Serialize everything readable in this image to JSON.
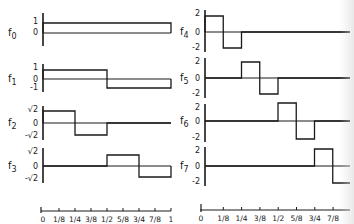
{
  "figure": {
    "ink_color": "#1a1a1a",
    "background": "#ffffff"
  },
  "left_panel": {
    "functions": [
      {
        "name": "f",
        "sub": "0",
        "ylabels": [
          "1",
          "0"
        ],
        "segments": [
          [
            0,
            1,
            1
          ]
        ]
      },
      {
        "name": "f",
        "sub": "1",
        "ylabels": [
          "1",
          "0",
          "-1"
        ],
        "segments": [
          [
            0,
            0.5,
            1
          ],
          [
            0.5,
            1,
            -1
          ]
        ]
      },
      {
        "name": "f",
        "sub": "2",
        "ylabels": [
          "√2",
          "0",
          "-√2"
        ],
        "segments": [
          [
            0,
            0.25,
            1.414
          ],
          [
            0.25,
            0.5,
            -1.414
          ],
          [
            0.5,
            1,
            0
          ]
        ]
      },
      {
        "name": "f",
        "sub": "3",
        "ylabels": [
          "√2",
          "0",
          "-√2"
        ],
        "segments": [
          [
            0,
            0.5,
            0
          ],
          [
            0.5,
            0.75,
            1.414
          ],
          [
            0.75,
            1,
            -1.414
          ]
        ]
      }
    ],
    "xaxis_ticks": [
      "0",
      "1/8",
      "1/4",
      "3/8",
      "1/2",
      "5/8",
      "3/4",
      "7/8",
      "1"
    ]
  },
  "right_panel": {
    "functions": [
      {
        "name": "f",
        "sub": "4",
        "ylabels": [
          "2",
          "0",
          "-2"
        ],
        "segments": [
          [
            0,
            0.125,
            2
          ],
          [
            0.125,
            0.25,
            -2
          ],
          [
            0.25,
            1,
            0
          ]
        ]
      },
      {
        "name": "f",
        "sub": "5",
        "ylabels": [
          "2",
          "0",
          "-2"
        ],
        "segments": [
          [
            0,
            0.25,
            0
          ],
          [
            0.25,
            0.375,
            2
          ],
          [
            0.375,
            0.5,
            -2
          ],
          [
            0.5,
            1,
            0
          ]
        ]
      },
      {
        "name": "f",
        "sub": "6",
        "ylabels": [
          "2",
          "0",
          "-2"
        ],
        "segments": [
          [
            0,
            0.5,
            0
          ],
          [
            0.5,
            0.625,
            2
          ],
          [
            0.625,
            0.75,
            -2
          ],
          [
            0.75,
            1,
            0
          ]
        ]
      },
      {
        "name": "f",
        "sub": "7",
        "ylabels": [
          "2",
          "0",
          "-2"
        ],
        "segments": [
          [
            0,
            0.75,
            0
          ],
          [
            0.75,
            0.875,
            2
          ],
          [
            0.875,
            1,
            -2
          ]
        ]
      }
    ],
    "xaxis_ticks": [
      "0",
      "1/8",
      "1/4",
      "3/8",
      "1/2",
      "5/8",
      "3/4",
      "7/8"
    ]
  },
  "chart_data": {
    "type": "line",
    "title": "",
    "xlabel": "",
    "ylabel": "",
    "xlim": [
      0,
      1
    ],
    "series": [
      {
        "name": "f0",
        "x": [
          0,
          1
        ],
        "values": [
          1,
          1
        ],
        "step": true
      },
      {
        "name": "f1",
        "x": [
          0,
          0.5,
          1
        ],
        "values": [
          1,
          -1,
          -1
        ],
        "step": true
      },
      {
        "name": "f2",
        "x": [
          0,
          0.25,
          0.5,
          1
        ],
        "values": [
          1.414,
          -1.414,
          0,
          0
        ],
        "step": true
      },
      {
        "name": "f3",
        "x": [
          0,
          0.5,
          0.75,
          1
        ],
        "values": [
          0,
          1.414,
          -1.414,
          -1.414
        ],
        "step": true
      },
      {
        "name": "f4",
        "x": [
          0,
          0.125,
          0.25,
          1
        ],
        "values": [
          2,
          -2,
          0,
          0
        ],
        "step": true
      },
      {
        "name": "f5",
        "x": [
          0,
          0.25,
          0.375,
          0.5,
          1
        ],
        "values": [
          0,
          2,
          -2,
          0,
          0
        ],
        "step": true
      },
      {
        "name": "f6",
        "x": [
          0,
          0.5,
          0.625,
          0.75,
          1
        ],
        "values": [
          0,
          2,
          -2,
          0,
          0
        ],
        "step": true
      },
      {
        "name": "f7",
        "x": [
          0,
          0.75,
          0.875,
          1
        ],
        "values": [
          0,
          2,
          -2,
          -2
        ],
        "step": true
      }
    ]
  }
}
